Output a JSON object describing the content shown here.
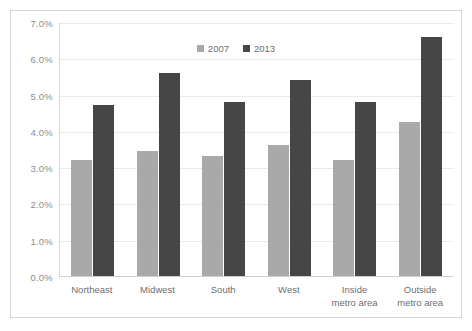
{
  "chart_data": {
    "type": "bar",
    "title": "",
    "subtitle": "",
    "xlabel": "",
    "ylabel": "",
    "categories": [
      "Northeast",
      "Midwest",
      "South",
      "West",
      "Inside metro area",
      "Outside metro area"
    ],
    "category_lines": [
      [
        "Northeast"
      ],
      [
        "Midwest"
      ],
      [
        "South"
      ],
      [
        "West"
      ],
      [
        "Inside",
        "metro area"
      ],
      [
        "Outside",
        "metro area"
      ]
    ],
    "series": [
      {
        "name": "2007",
        "color": "#a9a9a9",
        "values": [
          3.2,
          3.45,
          3.3,
          3.6,
          3.2,
          4.25
        ]
      },
      {
        "name": "2013",
        "color": "#464646",
        "values": [
          4.7,
          5.6,
          4.8,
          5.4,
          4.8,
          6.6
        ]
      }
    ],
    "ylim": [
      0.0,
      7.0
    ],
    "ytick_values": [
      0.0,
      1.0,
      2.0,
      3.0,
      4.0,
      5.0,
      6.0,
      7.0
    ],
    "ytick_labels": [
      "0.0%",
      "1.0%",
      "2.0%",
      "3.0%",
      "4.0%",
      "5.0%",
      "6.0%",
      "7.0%"
    ],
    "value_suffix": "%",
    "grid": true,
    "grid_axis": "y",
    "legend_position": "top-center",
    "legend_entries": [
      "2007",
      "2013"
    ],
    "data_labels_shown": false,
    "background_color": "#ffffff",
    "border_color": "#d6d6d6",
    "axis_label_color": "#8d8d8d",
    "gridline_color": "#e9e9e9"
  }
}
